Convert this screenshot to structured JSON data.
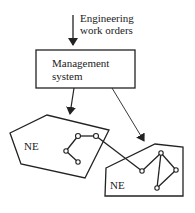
{
  "diagram": {
    "input_label_line1": "Engineering",
    "input_label_line2": "work orders",
    "management_box_line1": "Management",
    "management_box_line2": "system",
    "ne_left_label": "NE",
    "ne_right_label": "NE"
  },
  "colors": {
    "stroke": "#222222",
    "background": "#ffffff"
  }
}
